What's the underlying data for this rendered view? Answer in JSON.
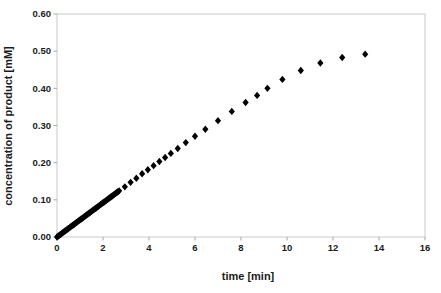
{
  "figure": {
    "background": "#ffffff",
    "frame_color": "#c9c9c9",
    "tick_color": "#a6a6a6",
    "text_color": "#1a1a1a"
  },
  "chart_data": {
    "type": "scatter",
    "title": "",
    "xlabel": "time [min]",
    "ylabel": "concentration of product [mM]",
    "xlim": [
      0,
      16
    ],
    "ylim": [
      0,
      0.6
    ],
    "xticks": [
      0,
      2,
      4,
      6,
      8,
      10,
      12,
      14,
      16
    ],
    "yticks": [
      0,
      0.1,
      0.2,
      0.3,
      0.4,
      0.5,
      0.6
    ],
    "ytick_labels": [
      "0.00",
      "0.10",
      "0.20",
      "0.30",
      "0.40",
      "0.50",
      "0.60"
    ],
    "grid": false,
    "legend_position": "none",
    "marker": "diamond",
    "marker_color": "#000000",
    "series": [
      {
        "name": "product",
        "points": [
          [
            0.0,
            0.0
          ],
          [
            0.05,
            0.0023
          ],
          [
            0.1,
            0.0046
          ],
          [
            0.15,
            0.0069
          ],
          [
            0.2,
            0.0092
          ],
          [
            0.25,
            0.0115
          ],
          [
            0.3,
            0.0138
          ],
          [
            0.35,
            0.0161
          ],
          [
            0.4,
            0.0184
          ],
          [
            0.45,
            0.0207
          ],
          [
            0.5,
            0.023
          ],
          [
            0.55,
            0.0253
          ],
          [
            0.6,
            0.0276
          ],
          [
            0.65,
            0.0299
          ],
          [
            0.7,
            0.0322
          ],
          [
            0.75,
            0.0345
          ],
          [
            0.8,
            0.0368
          ],
          [
            0.85,
            0.0391
          ],
          [
            0.9,
            0.0414
          ],
          [
            0.95,
            0.0437
          ],
          [
            1.0,
            0.046
          ],
          [
            1.05,
            0.0483
          ],
          [
            1.1,
            0.0506
          ],
          [
            1.15,
            0.0529
          ],
          [
            1.2,
            0.0552
          ],
          [
            1.25,
            0.0575
          ],
          [
            1.3,
            0.0598
          ],
          [
            1.35,
            0.0621
          ],
          [
            1.4,
            0.0644
          ],
          [
            1.45,
            0.0667
          ],
          [
            1.5,
            0.069
          ],
          [
            1.55,
            0.0713
          ],
          [
            1.6,
            0.0736
          ],
          [
            1.65,
            0.0759
          ],
          [
            1.7,
            0.0782
          ],
          [
            1.75,
            0.0805
          ],
          [
            1.8,
            0.0828
          ],
          [
            1.85,
            0.0851
          ],
          [
            1.9,
            0.0874
          ],
          [
            1.95,
            0.0897
          ],
          [
            2.0,
            0.092
          ],
          [
            2.05,
            0.0943
          ],
          [
            2.1,
            0.0966
          ],
          [
            2.15,
            0.0989
          ],
          [
            2.2,
            0.1012
          ],
          [
            2.25,
            0.1035
          ],
          [
            2.3,
            0.1058
          ],
          [
            2.35,
            0.1081
          ],
          [
            2.4,
            0.1104
          ],
          [
            2.45,
            0.1127
          ],
          [
            2.5,
            0.115
          ],
          [
            2.55,
            0.1173
          ],
          [
            2.6,
            0.1196
          ],
          [
            2.65,
            0.1219
          ],
          [
            2.7,
            0.1242
          ],
          [
            2.95,
            0.135
          ],
          [
            3.2,
            0.147
          ],
          [
            3.45,
            0.158
          ],
          [
            3.7,
            0.17
          ],
          [
            3.95,
            0.181
          ],
          [
            4.2,
            0.192
          ],
          [
            4.45,
            0.203
          ],
          [
            4.7,
            0.214
          ],
          [
            4.95,
            0.225
          ],
          [
            5.25,
            0.238
          ],
          [
            5.6,
            0.254
          ],
          [
            6.0,
            0.271
          ],
          [
            6.45,
            0.29
          ],
          [
            7.0,
            0.313
          ],
          [
            7.6,
            0.338
          ],
          [
            8.2,
            0.362
          ],
          [
            8.7,
            0.381
          ],
          [
            9.15,
            0.4
          ],
          [
            9.8,
            0.424
          ],
          [
            10.6,
            0.448
          ],
          [
            11.45,
            0.468
          ],
          [
            12.4,
            0.483
          ],
          [
            13.4,
            0.492
          ]
        ]
      }
    ]
  }
}
